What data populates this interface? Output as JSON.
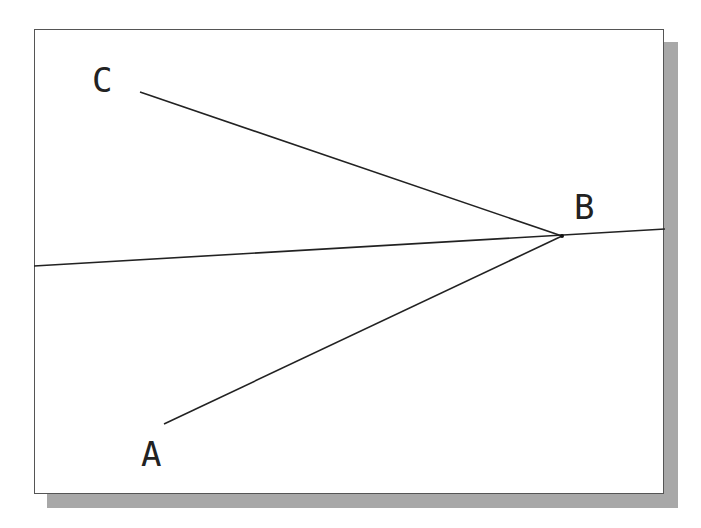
{
  "diagram": {
    "labels": [
      {
        "id": "A",
        "text": "A",
        "x": 141,
        "y": 437
      },
      {
        "id": "B",
        "text": "B",
        "x": 574,
        "y": 190
      },
      {
        "id": "C",
        "text": "C",
        "x": 92,
        "y": 63
      }
    ],
    "segments": [
      {
        "name": "segment-cb",
        "from": [
          140,
          92
        ],
        "to": [
          562,
          236
        ]
      },
      {
        "name": "segment-ab",
        "from": [
          164,
          424
        ],
        "to": [
          562,
          236
        ]
      },
      {
        "name": "line-through-b",
        "from": [
          34,
          266
        ],
        "to": [
          665,
          229
        ]
      }
    ],
    "colors": {
      "line": "#222222",
      "shadow": "#a8a8a8",
      "frame": "#555555"
    }
  }
}
